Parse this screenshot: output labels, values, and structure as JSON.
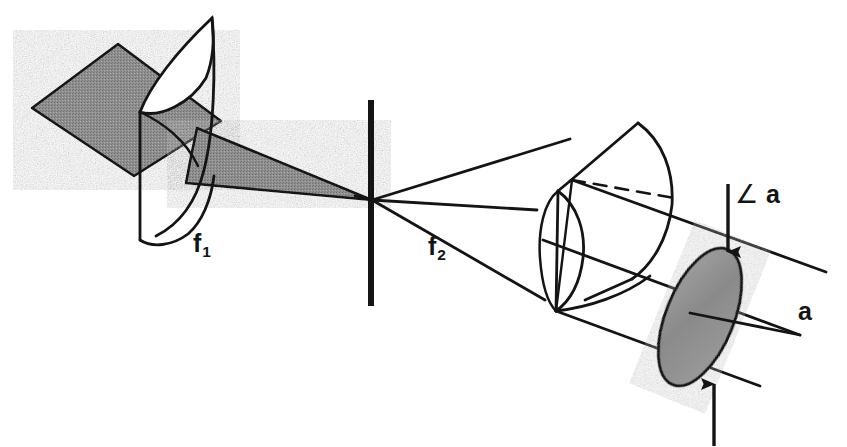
{
  "figure": {
    "domain": "Diagram",
    "background_color": "#ffffff",
    "ink_color": "#141414",
    "shade_fill": "#8c8c8c",
    "labels": {
      "focal_length_1": {
        "text": "f",
        "subscript": "1",
        "name": "f1"
      },
      "focal_length_2": {
        "text": "f",
        "subscript": "2",
        "name": "f2"
      },
      "angle_a": {
        "text": "a",
        "symbol": "∠",
        "name": "angle-a"
      },
      "aperture_a": {
        "text": "a",
        "name": "a"
      }
    },
    "elements": [
      {
        "name": "input-beam-sheet",
        "kind": "shaded-parallelogram",
        "label": ""
      },
      {
        "name": "cylindrical-lens-1",
        "kind": "cylinder-lens",
        "label": "f1"
      },
      {
        "name": "converging-beam-wedge",
        "kind": "shaded-triangle",
        "label": ""
      },
      {
        "name": "spatial-filter-slit",
        "kind": "vertical-bar",
        "label": ""
      },
      {
        "name": "focal-point",
        "kind": "ray-crossing",
        "label": ""
      },
      {
        "name": "diverging-rays",
        "kind": "three-rays",
        "label": "f2"
      },
      {
        "name": "cylindrical-lens-2",
        "kind": "cylinder-lens",
        "label": "f2"
      },
      {
        "name": "output-beam-tube",
        "kind": "parallel-lines",
        "label": ""
      },
      {
        "name": "output-spot-ellipse",
        "kind": "shaded-ellipse",
        "label": "a"
      },
      {
        "name": "dimension-arrow-down",
        "kind": "arrow",
        "label": "∠ a"
      },
      {
        "name": "dimension-arrow-up",
        "kind": "arrow",
        "label": "a"
      }
    ]
  }
}
